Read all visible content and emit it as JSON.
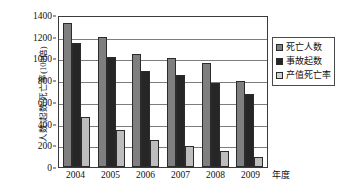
{
  "chart_data": {
    "type": "bar",
    "title": "",
    "xlabel": "年度",
    "ylabel": "人数/起数/死亡率(100倍)",
    "categories": [
      "2004",
      "2005",
      "2006",
      "2007",
      "2008",
      "2009"
    ],
    "series": [
      {
        "name": "死亡人数",
        "color": "#7f7f7f",
        "values": [
          1330,
          1195,
          1045,
          1000,
          955,
          790
        ]
      },
      {
        "name": "事故起数",
        "color": "#262626",
        "values": [
          1140,
          1015,
          880,
          850,
          775,
          675
        ]
      },
      {
        "name": "产值死亡率",
        "color": "#d2d2d2",
        "values": [
          460,
          345,
          245,
          190,
          145,
          95
        ]
      }
    ],
    "ylim": [
      0,
      1400
    ],
    "ytick_step": 200,
    "yticks": [
      "1400",
      "1200",
      "1000",
      "800",
      "600",
      "400",
      "200",
      "0"
    ],
    "grid": true,
    "legend_position": "right"
  }
}
